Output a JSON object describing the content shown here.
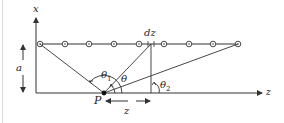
{
  "labels": {
    "x_axis": "x",
    "z_axis": "z",
    "dz": "dz",
    "a": "a",
    "P": "P",
    "z_distance": "z",
    "theta": "θ",
    "theta1": "θ",
    "theta1_sub": "1",
    "theta2": "θ",
    "theta2_sub": "2"
  },
  "colors": {
    "line": "#333333",
    "text": "#222222",
    "background": "#ffffff"
  },
  "wire": {
    "charge_count": 9,
    "charge_symbol": "circle-dot"
  }
}
